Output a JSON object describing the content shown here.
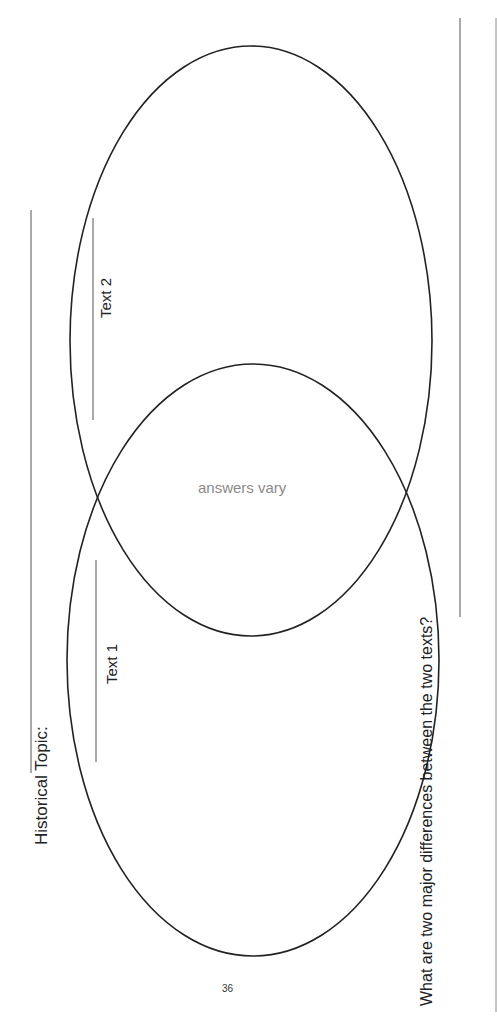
{
  "worksheet": {
    "historical_topic_label": "Historical Topic:",
    "question_label": "What are two major differences between the two texts?",
    "page_number": "36"
  },
  "venn": {
    "circle_left_label": "Text 1",
    "circle_right_label": "Text 2",
    "overlap_text": "answers vary",
    "overlap_text_color": "#8a8a8a",
    "stroke_color": "#222222"
  }
}
